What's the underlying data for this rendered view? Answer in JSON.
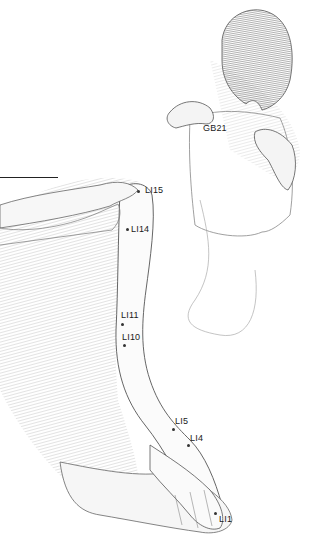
{
  "illustration": {
    "subject": "acupressure-points-arm-shoulder",
    "colors": {
      "ink": "#1a1a1a",
      "shading": "#8a8a8a",
      "background": "#ffffff"
    }
  },
  "points": [
    {
      "id": "GB21",
      "label": "GB21",
      "dot": [
        0,
        0
      ],
      "label_pos": [
        203,
        124
      ],
      "has_dot": false
    },
    {
      "id": "LI15",
      "label": "LI15",
      "dot": [
        138,
        191
      ],
      "label_pos": [
        145,
        186
      ]
    },
    {
      "id": "LI14",
      "label": "LI14",
      "dot": [
        127,
        229
      ],
      "label_pos": [
        131,
        225
      ]
    },
    {
      "id": "LI11",
      "label": "LI11",
      "dot": [
        122,
        324
      ],
      "label_pos": [
        121,
        311
      ]
    },
    {
      "id": "LI10",
      "label": "LI10",
      "dot": [
        124,
        345
      ],
      "label_pos": [
        122,
        333
      ]
    },
    {
      "id": "LI5",
      "label": "LI5",
      "dot": [
        173,
        429
      ],
      "label_pos": [
        175,
        417
      ]
    },
    {
      "id": "LI4",
      "label": "LI4",
      "dot": [
        188,
        445
      ],
      "label_pos": [
        190,
        434
      ]
    },
    {
      "id": "LI1",
      "label": "LI1",
      "dot": [
        215,
        513
      ],
      "label_pos": [
        219,
        515
      ]
    }
  ]
}
